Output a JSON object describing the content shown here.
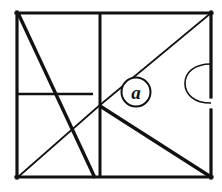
{
  "figure": {
    "background_color": "#ffffff",
    "stroke_color": "#111111",
    "canvas": {
      "width": 222,
      "height": 192
    },
    "frame": {
      "name": "outer-rectangle",
      "left": 16,
      "top": 12,
      "right": 212,
      "bottom": 178,
      "stroke_width": 3.2
    },
    "labels": [
      {
        "id": "label-a",
        "text": "a",
        "style": "circled-italic",
        "center_x": 136,
        "center_y": 92,
        "radius": 14.5,
        "circle_stroke_width": 2.0
      }
    ],
    "segments": [
      {
        "id": "vertical-divider",
        "name": "vertical-divider-line",
        "x1": 100,
        "y1": 12,
        "x2": 100,
        "y2": 178,
        "stroke_width": 3.0,
        "weight": "thick"
      },
      {
        "id": "horizontal-left",
        "name": "horizontal-left-line",
        "x1": 16,
        "y1": 94,
        "x2": 93,
        "y2": 94,
        "stroke_width": 2.6,
        "weight": "thick"
      },
      {
        "id": "diagonal-topleft-to-bottom",
        "name": "thick-diagonal-descending",
        "x1": 18,
        "y1": 13,
        "x2": 95,
        "y2": 178,
        "stroke_width": 3.4,
        "weight": "thick"
      },
      {
        "id": "diagonal-center-to-topright",
        "name": "thin-diagonal-to-top-right-corner",
        "x1": 100,
        "y1": 105,
        "x2": 211,
        "y2": 13,
        "stroke_width": 1.7,
        "weight": "thin"
      },
      {
        "id": "diagonal-center-to-bottomleft",
        "name": "thin-diagonal-to-bottom-left-corner",
        "x1": 100,
        "y1": 105,
        "x2": 18,
        "y2": 177,
        "stroke_width": 1.7,
        "weight": "thin"
      },
      {
        "id": "diagonal-center-to-bottomright",
        "name": "thick-diagonal-to-bottom-right-corner",
        "x1": 100,
        "y1": 106,
        "x2": 211,
        "y2": 177,
        "stroke_width": 3.4,
        "weight": "thick"
      }
    ],
    "arcs": [
      {
        "id": "right-edge-semicircle",
        "name": "semicircle-bulge-left",
        "attach_x": 211,
        "top_y": 64,
        "bottom_y": 103,
        "bulge_depth": 26,
        "stroke_width": 1.6,
        "direction": "left"
      }
    ],
    "gaps": [
      {
        "id": "right-border-gap",
        "name": "gap-in-right-border",
        "x": 211,
        "from_y": 97,
        "to_y": 110
      }
    ],
    "junction": {
      "name": "center-junction-point",
      "x": 100,
      "y": 105
    }
  }
}
